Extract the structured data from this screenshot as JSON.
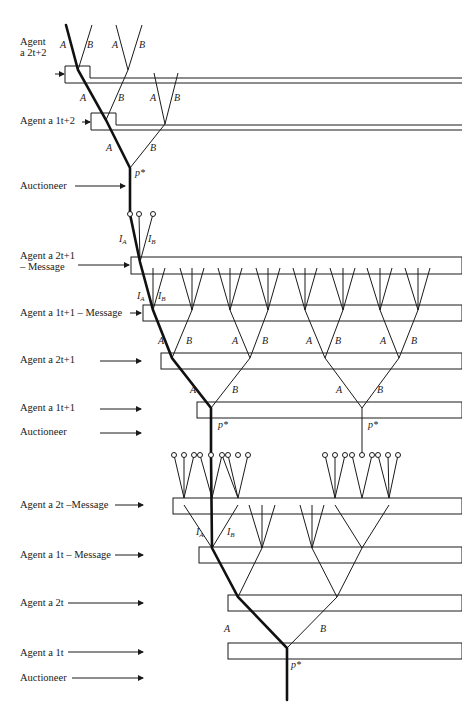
{
  "labels": [
    {
      "id": "agent-a2t2",
      "x": 20,
      "y": 36,
      "line1": "Agent",
      "line2": "a 2t+2"
    },
    {
      "id": "agent-a1t2",
      "x": 20,
      "y": 120,
      "line1": "Agent  a 1t+2",
      "line2": ""
    },
    {
      "id": "auctioneer-1",
      "x": 20,
      "y": 183,
      "line1": "Auctioneer",
      "line2": ""
    },
    {
      "id": "agent-a2t1-msg",
      "x": 20,
      "y": 252,
      "line1": "Agent  a 2t+1",
      "line2": "– Message"
    },
    {
      "id": "agent-a1t1-msg",
      "x": 20,
      "y": 310,
      "line1": "Agent  a 1t+1 – Message",
      "line2": ""
    },
    {
      "id": "agent-a2t1",
      "x": 20,
      "y": 356,
      "line1": "Agent  a 2t+1",
      "line2": ""
    },
    {
      "id": "agent-a1t1",
      "x": 20,
      "y": 405,
      "line1": "Agent  a 1t+1",
      "line2": ""
    },
    {
      "id": "auctioneer-2",
      "x": 20,
      "y": 429,
      "line1": "Auctioneer",
      "line2": ""
    },
    {
      "id": "agent-a2t-msg",
      "x": 20,
      "y": 499,
      "line1": "Agent  a 2t –Message",
      "line2": ""
    },
    {
      "id": "agent-a1t-msg",
      "x": 20,
      "y": 549,
      "line1": "Agent  a 1t – Message",
      "line2": ""
    },
    {
      "id": "agent-a2t",
      "x": 20,
      "y": 600,
      "line1": "Agent  a 2t",
      "line2": ""
    },
    {
      "id": "agent-a1t",
      "x": 20,
      "y": 650,
      "line1": "Agent  a 1t",
      "line2": ""
    },
    {
      "id": "auctioneer-3",
      "x": 20,
      "y": 676,
      "line1": "Auctioneer",
      "line2": ""
    }
  ],
  "branch_labels": {
    "A": "A",
    "B": "B",
    "IA": "I",
    "IA_sub": "A",
    "IB": "I",
    "IB_sub": "B",
    "price_star": "p*",
    "price_t2": "p t+2",
    "price_t1": "p t+1"
  },
  "caption": "",
  "colors": {
    "line": "#1a1a1a",
    "bold": "#111111"
  }
}
